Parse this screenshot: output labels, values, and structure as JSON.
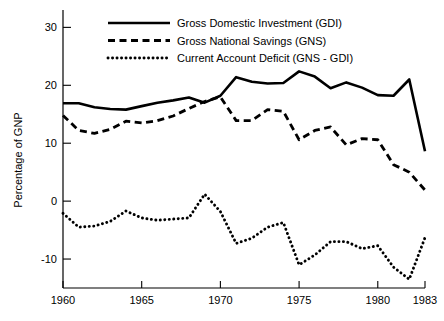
{
  "chart_data": {
    "type": "line",
    "title": "",
    "xlabel": "",
    "ylabel": "Percentage of GNP",
    "xlim": [
      1960,
      1983
    ],
    "ylim": [
      -15,
      33
    ],
    "grid": false,
    "legend_position": "top-center",
    "x_ticks": [
      1960,
      1965,
      1970,
      1975,
      1980,
      1983
    ],
    "x_tick_labels": [
      "1960",
      "1965",
      "1970",
      "1975",
      "1980",
      "1983"
    ],
    "y_ticks": [
      -10,
      0,
      10,
      20,
      30
    ],
    "y_tick_labels": [
      "-10",
      "0",
      "10",
      "20",
      "30"
    ],
    "x": [
      1960,
      1961,
      1962,
      1963,
      1964,
      1965,
      1966,
      1967,
      1968,
      1969,
      1970,
      1971,
      1972,
      1973,
      1974,
      1975,
      1976,
      1977,
      1978,
      1979,
      1980,
      1981,
      1982,
      1983
    ],
    "series": [
      {
        "name": "Gross Domestic Investment (GDI)",
        "style": "solid",
        "color": "#000000",
        "values": [
          16.9,
          16.9,
          16.2,
          15.9,
          15.8,
          16.4,
          17.0,
          17.4,
          17.9,
          17.0,
          18.2,
          21.4,
          20.6,
          20.3,
          20.4,
          22.4,
          21.5,
          19.5,
          20.5,
          19.6,
          18.3,
          18.2,
          21.0,
          8.6
        ]
      },
      {
        "name": "Gross National Savings (GNS)",
        "style": "dashed",
        "color": "#000000",
        "values": [
          14.8,
          12.2,
          11.7,
          12.4,
          13.8,
          13.5,
          13.9,
          14.7,
          16.0,
          17.2,
          18.0,
          13.9,
          13.9,
          15.8,
          15.5,
          10.6,
          12.2,
          12.8,
          9.7,
          10.8,
          10.6,
          6.3,
          5.0,
          1.9
        ]
      },
      {
        "name": "Current  Account Deficit (GNS - GDI)",
        "style": "dotted",
        "color": "#000000",
        "values": [
          -2.1,
          -4.5,
          -4.3,
          -3.5,
          -1.7,
          -2.9,
          -3.3,
          -3.1,
          -2.9,
          1.2,
          -1.8,
          -7.3,
          -6.4,
          -4.5,
          -3.7,
          -11.0,
          -9.3,
          -7.0,
          -7.0,
          -8.2,
          -7.7,
          -11.4,
          -13.5,
          -6.3
        ]
      }
    ]
  },
  "legend": {
    "items": [
      {
        "label": "Gross Domestic Investment (GDI)",
        "style": "solid"
      },
      {
        "label": "Gross National Savings (GNS)",
        "style": "dashed"
      },
      {
        "label": "Current  Account Deficit (GNS - GDI)",
        "style": "dotted"
      }
    ]
  },
  "axes": {
    "y_title": "Percentage of GNP"
  }
}
